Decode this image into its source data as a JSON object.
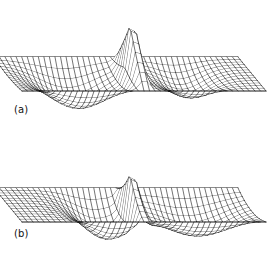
{
  "figure": {
    "background_color": "#ffffff",
    "line_color": "#000000",
    "width": 269,
    "height": 253,
    "panels": [
      {
        "id": "a",
        "label": "(a)",
        "description": "Perspective wireframe mesh of a surface with a sharp narrow positive spike and two negative lobes"
      },
      {
        "id": "b",
        "label": "(b)",
        "description": "Perspective wireframe mesh of a surface with a sharp narrow positive spike, a central negative lobe and a large right negative lobe"
      }
    ]
  },
  "chart_data": [
    {
      "type": "surface",
      "panel": "a",
      "title": "(a)",
      "xlabel": "",
      "ylabel": "",
      "zlabel": "",
      "grid": true,
      "legend": false,
      "projection": "3d-perspective",
      "mesh_nu": 34,
      "mesh_nv": 12,
      "xlim": [
        -1,
        1
      ],
      "ylim": [
        -1,
        1
      ],
      "zlim": [
        -0.55,
        1.0
      ],
      "notes": "Flat zero plane at far left and far right. Deep broad negative lobe left of center, sharp tall positive spike near center, smaller negative lobe right of center.",
      "features": [
        {
          "name": "left-flat-plane",
          "u_range": [
            -1.0,
            -0.82
          ],
          "z": 0.0
        },
        {
          "name": "left-negative-lobe",
          "u_center": -0.45,
          "z_min": -0.52,
          "half_width": 0.4
        },
        {
          "name": "central-positive-spike",
          "u_center": 0.02,
          "z_max": 1.0,
          "half_width": 0.07
        },
        {
          "name": "right-negative-lobe",
          "u_center": 0.45,
          "z_min": -0.33,
          "half_width": 0.26
        },
        {
          "name": "right-flat-plane",
          "u_range": [
            0.74,
            1.0
          ],
          "z": 0.0
        }
      ]
    },
    {
      "type": "surface",
      "panel": "b",
      "title": "(b)",
      "xlabel": "",
      "ylabel": "",
      "zlabel": "",
      "grid": true,
      "legend": false,
      "projection": "3d-perspective",
      "mesh_nu": 34,
      "mesh_nv": 12,
      "xlim": [
        -1,
        1
      ],
      "ylim": [
        -1,
        1
      ],
      "zlim": [
        -0.55,
        1.0
      ],
      "notes": "Flat zero plane at far left. Negative lobe just left of center, sharp tall positive spike with near-vertical left edge at center, large wide negative lobe filling the right half.",
      "features": [
        {
          "name": "left-flat-plane",
          "u_range": [
            -1.0,
            -0.56
          ],
          "z": 0.0
        },
        {
          "name": "left-negative-lobe",
          "u_center": -0.22,
          "z_min": -0.5,
          "half_width": 0.3
        },
        {
          "name": "central-positive-spike",
          "u_center": 0.02,
          "z_max": 1.0,
          "half_width": 0.05
        },
        {
          "name": "right-negative-lobe",
          "u_center": 0.52,
          "z_min": -0.46,
          "half_width": 0.44
        }
      ]
    }
  ]
}
